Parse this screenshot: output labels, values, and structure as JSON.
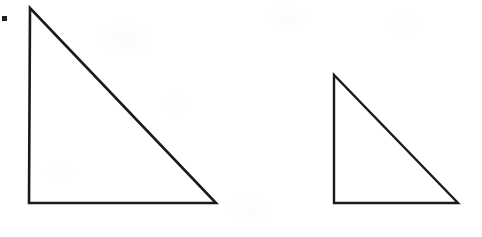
{
  "figure": {
    "background_color": "#ffffff",
    "stroke_color": "#1a1a1a",
    "width": 482,
    "height": 237
  },
  "marks": [
    {
      "name": "corner-square-mark",
      "shape": "filled-square",
      "x": 2,
      "y": 16,
      "size": 5,
      "color": "#1f1f1f"
    }
  ],
  "shapes": [
    {
      "name": "large-right-triangle",
      "label": "Large right triangle",
      "type": "right-triangle",
      "orientation": "right-angle-bottom-left",
      "stroke_width": 2.6,
      "fill": "none",
      "vertices": {
        "apex": {
          "x": 30,
          "y": 8
        },
        "bottom_left": {
          "x": 29,
          "y": 203
        },
        "bottom_right": {
          "x": 216,
          "y": 203
        }
      },
      "legs": {
        "vertical": 195,
        "horizontal": 187
      },
      "points_attr": "30,8 29,203 216,203"
    },
    {
      "name": "small-right-triangle",
      "label": "Small right triangle",
      "type": "right-triangle",
      "orientation": "right-angle-bottom-left",
      "stroke_width": 2.4,
      "fill": "none",
      "vertices": {
        "apex": {
          "x": 334,
          "y": 75
        },
        "bottom_left": {
          "x": 334,
          "y": 203
        },
        "bottom_right": {
          "x": 458,
          "y": 203
        }
      },
      "legs": {
        "vertical": 128,
        "horizontal": 124
      },
      "points_attr": "334,75 334,203 458,203"
    }
  ]
}
